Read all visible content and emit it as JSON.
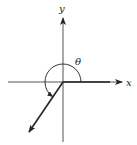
{
  "diagram": {
    "type": "angle-in-standard-position",
    "labels": {
      "x_axis": "x",
      "y_axis": "y",
      "angle": "θ"
    },
    "angle_description": "reflex angle measured counterclockwise from positive x-axis, terminal side in quadrant III",
    "colors": {
      "stroke": "#222222",
      "background": "#ffffff"
    }
  }
}
